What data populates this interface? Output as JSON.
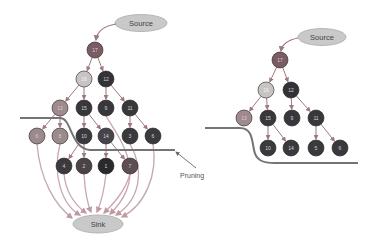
{
  "colors": {
    "dark": "#3a3a3e",
    "darker": "#2a2a2e",
    "mid": "#7a6268",
    "light": "#c9c4c4",
    "pink": "#a88890",
    "ellipse": "#c9c9c9",
    "edge": "#c9a7ae",
    "pruneLine": "#747474"
  },
  "left": {
    "source": {
      "label": "Source",
      "x": 141,
      "y": 23
    },
    "sink": {
      "label": "Sink",
      "x": 98,
      "y": 224
    },
    "pruning_label": "Pruning",
    "nodes": [
      {
        "id": "a17",
        "label": "17",
        "x": 95,
        "y": 50,
        "fill": "#7a5c62"
      },
      {
        "id": "a16",
        "label": "16",
        "x": 84,
        "y": 79,
        "fill": "#c9c4c4"
      },
      {
        "id": "a12",
        "label": "12",
        "x": 106,
        "y": 79,
        "fill": "#333337"
      },
      {
        "id": "a13",
        "label": "13",
        "x": 60,
        "y": 108,
        "fill": "#a08a8e"
      },
      {
        "id": "a15",
        "label": "15",
        "x": 84,
        "y": 108,
        "fill": "#38383c"
      },
      {
        "id": "a9",
        "label": "9",
        "x": 106,
        "y": 108,
        "fill": "#38383c"
      },
      {
        "id": "a11",
        "label": "11",
        "x": 130,
        "y": 108,
        "fill": "#38383c"
      },
      {
        "id": "a6",
        "label": "6",
        "x": 37,
        "y": 136,
        "fill": "#9a8a8c"
      },
      {
        "id": "a8",
        "label": "8",
        "x": 60,
        "y": 136,
        "fill": "#9a8a8c"
      },
      {
        "id": "a10",
        "label": "10",
        "x": 84,
        "y": 136,
        "fill": "#3a3a3e"
      },
      {
        "id": "a14",
        "label": "14",
        "x": 106,
        "y": 136,
        "fill": "#46434a"
      },
      {
        "id": "a3",
        "label": "3",
        "x": 130,
        "y": 136,
        "fill": "#3a3a3e"
      },
      {
        "id": "a6b",
        "label": "6",
        "x": 153,
        "y": 136,
        "fill": "#3a3a3e"
      },
      {
        "id": "a4",
        "label": "4",
        "x": 64,
        "y": 166,
        "fill": "#3c3a3e"
      },
      {
        "id": "a2",
        "label": "2",
        "x": 84,
        "y": 166,
        "fill": "#4a4448"
      },
      {
        "id": "a1",
        "label": "1",
        "x": 106,
        "y": 166,
        "fill": "#2a2a2e"
      },
      {
        "id": "a7",
        "label": "7",
        "x": 130,
        "y": 166,
        "fill": "#5e4e54"
      }
    ],
    "edges": [
      [
        "a17",
        "a16"
      ],
      [
        "a17",
        "a12"
      ],
      [
        "a16",
        "a13"
      ],
      [
        "a16",
        "a15"
      ],
      [
        "a12",
        "a9"
      ],
      [
        "a12",
        "a11"
      ],
      [
        "a13",
        "a6"
      ],
      [
        "a13",
        "a8"
      ],
      [
        "a15",
        "a10"
      ],
      [
        "a15",
        "a14"
      ],
      [
        "a11",
        "a3"
      ],
      [
        "a11",
        "a6b"
      ],
      [
        "a10",
        "a4"
      ],
      [
        "a10",
        "a2"
      ],
      [
        "a14",
        "a1"
      ],
      [
        "a14",
        "a7"
      ]
    ]
  },
  "right": {
    "source": {
      "label": "Source",
      "x": 322,
      "y": 37
    },
    "nodes": [
      {
        "id": "b17",
        "label": "17",
        "x": 280,
        "y": 60,
        "fill": "#7a5c62"
      },
      {
        "id": "b16",
        "label": "16",
        "x": 266,
        "y": 90,
        "fill": "#c9c4c4"
      },
      {
        "id": "b12",
        "label": "12",
        "x": 291,
        "y": 90,
        "fill": "#333337"
      },
      {
        "id": "b13",
        "label": "13",
        "x": 244,
        "y": 118,
        "fill": "#a08a8e"
      },
      {
        "id": "b15",
        "label": "15",
        "x": 268,
        "y": 118,
        "fill": "#38383c"
      },
      {
        "id": "b9",
        "label": "9",
        "x": 292,
        "y": 118,
        "fill": "#38383c"
      },
      {
        "id": "b11",
        "label": "11",
        "x": 316,
        "y": 118,
        "fill": "#38383c"
      },
      {
        "id": "b10",
        "label": "10",
        "x": 268,
        "y": 148,
        "fill": "#3a3a3e"
      },
      {
        "id": "b14",
        "label": "14",
        "x": 291,
        "y": 148,
        "fill": "#3a3a3e"
      },
      {
        "id": "b5",
        "label": "5",
        "x": 316,
        "y": 148,
        "fill": "#3a3a3e"
      },
      {
        "id": "b6",
        "label": "6",
        "x": 340,
        "y": 148,
        "fill": "#3a3a3e"
      }
    ],
    "edges": [
      [
        "b17",
        "b16"
      ],
      [
        "b17",
        "b12"
      ],
      [
        "b16",
        "b13"
      ],
      [
        "b16",
        "b15"
      ],
      [
        "b12",
        "b9"
      ],
      [
        "b12",
        "b11"
      ],
      [
        "b15",
        "b10"
      ],
      [
        "b15",
        "b14"
      ],
      [
        "b11",
        "b5"
      ],
      [
        "b11",
        "b6"
      ]
    ]
  }
}
